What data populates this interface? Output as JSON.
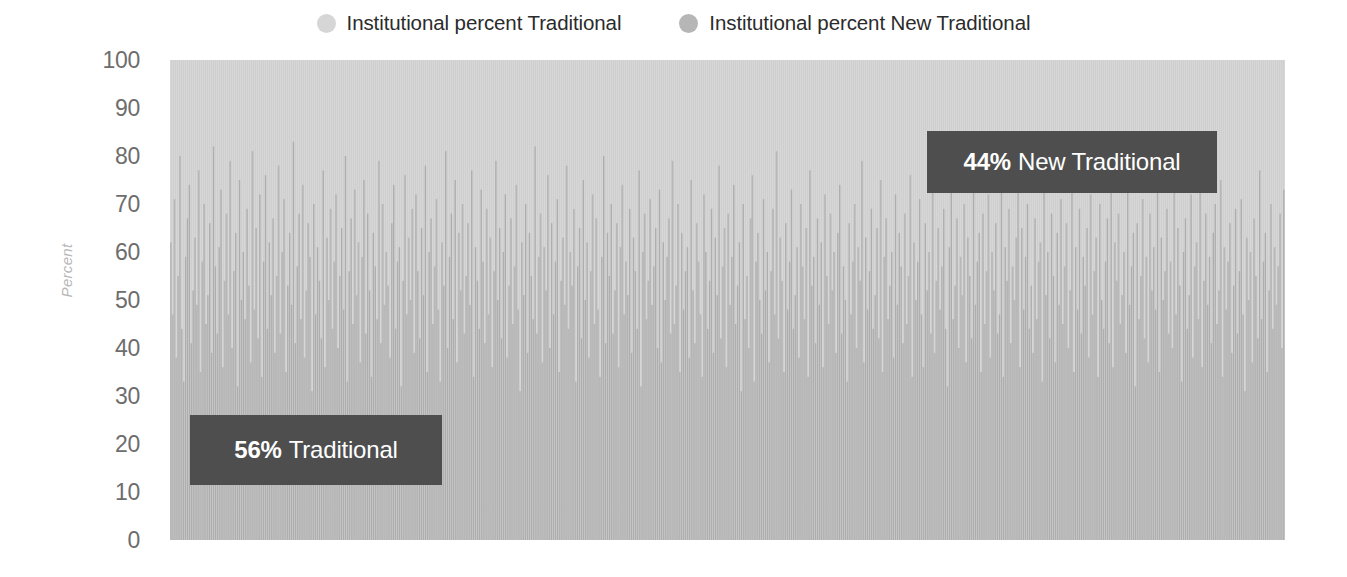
{
  "legend": {
    "position": "top-center",
    "entries": [
      {
        "label": "Institutional percent Traditional",
        "marker": "circle-swatch-icon",
        "color": "#d6d6d6"
      },
      {
        "label": "Institutional percent New Traditional",
        "marker": "circle-swatch-icon",
        "color": "#b6b6b6"
      }
    ]
  },
  "axis": {
    "y_title": "Percent",
    "ticks": [
      "100",
      "90",
      "80",
      "70",
      "60",
      "50",
      "40",
      "30",
      "20",
      "10",
      "0"
    ]
  },
  "annotations": [
    {
      "name": "annotation-traditional",
      "pct": "56%",
      "text": "New Traditional placeholder",
      "label": "Traditional",
      "bg": "#4e4e4e",
      "fg": "#ffffff"
    },
    {
      "name": "annotation-new-traditional",
      "pct": "44%",
      "label": "New Traditional",
      "bg": "#4e4e4e",
      "fg": "#ffffff"
    }
  ],
  "colors": {
    "traditional": "#b0b0b0",
    "new_traditional": "#d2d2d2",
    "annotation_bg": "#4e4e4e",
    "tick_text": "#6d6d6d",
    "axis_title": "#b7b7b7",
    "legend_text": "#2b2b2b",
    "plot_background": "#d2d2d2"
  },
  "chart_data": {
    "type": "bar",
    "stacked": true,
    "orientation": "vertical",
    "title": "",
    "subtitle": "",
    "xlabel": "",
    "ylabel": "Percent",
    "ylim": [
      0,
      100
    ],
    "yticks": [
      0,
      10,
      20,
      30,
      40,
      50,
      60,
      70,
      80,
      90,
      100
    ],
    "grid": false,
    "legend_position": "top-center",
    "x_axis_visible_labels": [],
    "summary": {
      "traditional_overall_percent": 56,
      "new_traditional_overall_percent": 44
    },
    "series": [
      {
        "name": "Institutional percent Traditional",
        "color": "#b0b0b0",
        "stack_order": 0,
        "values": [
          62,
          47,
          71,
          38,
          55,
          80,
          44,
          33,
          59,
          67,
          74,
          41,
          52,
          63,
          49,
          77,
          35,
          58,
          70,
          45,
          51,
          66,
          39,
          82,
          57,
          43,
          61,
          73,
          36,
          54,
          68,
          47,
          79,
          40,
          56,
          64,
          32,
          75,
          50,
          60,
          46,
          69,
          53,
          37,
          81,
          48,
          65,
          42,
          72,
          34,
          58,
          76,
          44,
          62,
          51,
          67,
          39,
          55,
          78,
          43,
          60,
          71,
          35,
          53,
          64,
          49,
          83,
          41,
          57,
          68,
          46,
          74,
          38,
          52,
          66,
          59,
          31,
          70,
          47,
          61,
          54,
          42,
          77,
          36,
          63,
          50,
          69,
          44,
          58,
          72,
          40,
          55,
          65,
          48,
          80,
          33,
          56,
          67,
          45,
          73,
          51,
          62,
          37,
          59,
          75,
          43,
          68,
          52,
          34,
          64,
          57,
          46,
          79,
          41,
          70,
          49,
          60,
          53,
          38,
          66,
          74,
          44,
          58,
          61,
          32,
          54,
          76,
          47,
          63,
          50,
          69,
          39,
          72,
          56,
          42,
          65,
          51,
          78,
          35,
          60,
          67,
          45,
          57,
          71,
          48,
          33,
          62,
          53,
          81,
          40,
          59,
          68,
          46,
          75,
          37,
          64,
          52,
          70,
          43,
          55,
          66,
          49,
          77,
          34,
          61,
          54,
          44,
          73,
          58,
          41,
          69,
          47,
          63,
          36,
          56,
          79,
          50,
          65,
          42,
          60,
          72,
          38,
          53,
          67,
          45,
          57,
          74,
          48,
          31,
          62,
          51,
          70,
          39,
          64,
          55,
          46,
          82,
          43,
          59,
          68,
          37,
          61,
          52,
          76,
          40,
          66,
          47,
          58,
          71,
          35,
          54,
          63,
          49,
          78,
          44,
          60,
          53,
          69,
          33,
          57,
          65,
          42,
          75,
          50,
          62,
          38,
          56,
          72,
          45,
          67,
          48,
          34,
          59,
          80,
          41,
          64,
          55,
          70,
          43,
          52,
          66,
          36,
          61,
          74,
          47,
          58,
          51,
          69,
          39,
          63,
          56,
          44,
          77,
          32,
          60,
          68,
          46,
          54,
          71,
          49,
          57,
          65,
          40,
          73,
          37,
          62,
          50,
          59,
          67,
          43,
          79,
          45,
          53,
          70,
          35,
          64,
          48,
          56,
          61,
          38,
          75,
          52,
          41,
          66,
          58,
          47,
          34,
          72,
          60,
          44,
          54,
          69,
          39,
          63,
          51,
          78,
          42,
          57,
          65,
          36,
          68,
          49,
          59,
          74,
          45,
          53,
          62,
          31,
          70,
          46,
          55,
          40,
          67,
          76,
          33,
          58,
          64,
          50,
          43,
          71,
          52,
          60,
          37,
          56,
          69,
          47,
          81,
          42,
          63,
          54,
          35,
          66,
          48,
          58,
          73,
          44,
          51,
          61,
          38,
          70,
          57,
          46,
          65,
          34,
          77,
          53,
          59,
          41,
          67,
          49,
          62,
          36,
          72,
          55,
          45,
          68,
          52,
          60,
          39,
          64,
          74,
          43,
          57,
          50,
          33,
          66,
          47,
          58,
          70,
          40,
          61,
          54,
          79,
          37,
          63,
          48,
          56,
          69,
          44,
          51,
          65,
          42,
          75,
          35,
          59,
          67,
          46,
          53,
          60,
          38,
          72,
          49,
          64,
          57,
          41,
          68,
          45,
          55,
          76,
          34,
          62,
          50,
          58,
          71,
          47,
          36,
          66,
          52,
          60,
          43,
          78,
          39,
          54,
          65,
          48,
          57,
          69,
          44,
          32,
          61,
          73,
          46,
          53,
          67,
          40,
          59,
          51,
          70,
          37,
          63,
          55,
          42,
          80,
          49,
          58,
          64,
          35,
          68,
          45,
          56,
          72,
          38,
          60,
          52,
          66,
          43,
          47,
          75,
          34,
          61,
          54,
          69,
          41,
          57,
          50,
          63,
          77,
          36,
          65,
          48,
          59,
          70,
          44,
          53,
          39,
          67,
          46,
          58,
          62,
          33,
          74,
          51,
          60,
          42,
          68,
          55,
          37,
          64,
          49,
          71,
          45,
          57,
          66,
          40,
          52,
          79,
          35,
          61,
          48,
          69,
          43,
          59,
          53,
          65,
          38,
          72,
          47,
          56,
          63,
          34,
          70,
          50,
          44,
          58,
          67,
          41,
          76,
          36,
          62,
          54,
          68,
          45,
          51,
          60,
          39,
          73,
          49,
          57,
          64,
          32,
          66,
          46,
          55,
          71,
          42,
          59,
          37,
          68,
          52,
          61,
          48,
          78,
          35,
          63,
          50,
          56,
          69,
          43,
          58,
          40,
          74,
          47,
          65,
          53,
          33,
          60,
          67,
          44,
          51,
          72,
          38,
          57,
          62,
          46,
          80,
          36,
          54,
          68,
          49,
          59,
          41,
          64,
          70,
          45,
          52,
          75,
          34,
          61,
          48,
          58,
          66,
          39,
          53,
          69,
          43,
          56,
          71,
          47,
          31,
          63,
          50,
          60,
          37,
          67,
          55,
          42,
          77,
          46,
          58,
          64,
          35,
          52,
          70,
          44,
          61,
          49,
          57,
          68,
          40,
          73
        ]
      },
      {
        "name": "Institutional percent New Traditional",
        "color": "#d2d2d2",
        "stack_order": 1,
        "note": "Fills each bar from the Traditional value up to 100 percent"
      }
    ]
  }
}
